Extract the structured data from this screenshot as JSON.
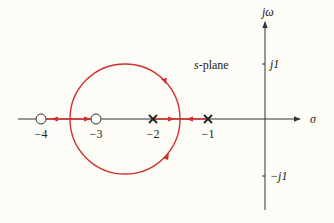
{
  "diagram": {
    "type": "root-locus",
    "plane_label_italic": "s",
    "plane_label_rest": "-plane",
    "axes": {
      "real_label": "σ",
      "imag_label": "jω",
      "imag_ticks": [
        "j1",
        "−j1"
      ]
    },
    "real_ticks": [
      "−4",
      "−3",
      "−2",
      "−1"
    ],
    "poles": [
      -2,
      -1
    ],
    "zeros": [
      -4,
      -3
    ],
    "locus_color": "#d32f2f",
    "axis_color": "#333333"
  }
}
